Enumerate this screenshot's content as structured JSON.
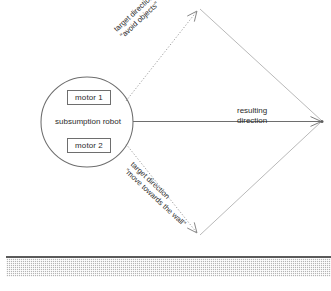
{
  "figure": {
    "robot": {
      "label": "subsumption robot",
      "motor_1": "motor 1",
      "motor_2": "motor 2"
    },
    "vectors": {
      "avoid": {
        "line1": "target direction",
        "line2": "\"avoid objects\""
      },
      "wall": {
        "line1": "target direction",
        "line2": "\"move towards the wall\""
      },
      "resulting": {
        "line1": "resulting",
        "line2": "direction"
      }
    },
    "wall_surface": {
      "name": "wall"
    },
    "colors": {
      "stroke": "#6e6e6e",
      "thin_stroke": "#9a9a9a",
      "text": "#2b2b2b",
      "wall_fill": "#b4b4b4",
      "wall_edge": "#5a5a5a",
      "background": "#ffffff"
    },
    "geometry": {
      "circle_center_x": 87,
      "circle_center_y": 122,
      "circle_radius_x": 46,
      "circle_radius_y": 45,
      "apex_top_x": 200,
      "apex_top_y": 8,
      "apex_bottom_x": 200,
      "apex_bottom_y": 236,
      "apex_right_x": 322,
      "apex_right_y": 121
    }
  }
}
